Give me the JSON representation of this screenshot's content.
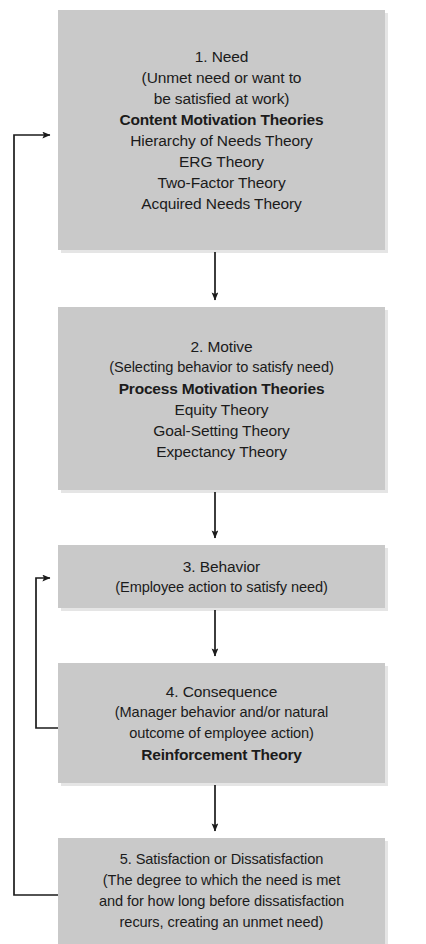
{
  "diagram": {
    "box_fill": "#c9c9c9",
    "line_color": "#1b1b1b",
    "text_color": "#1b1b1b"
  },
  "nodes": [
    {
      "id": "need",
      "step": "1. Need",
      "lines": [
        {
          "text": "1. Need",
          "bold": false
        },
        {
          "text": "(Unmet need or want to",
          "bold": false
        },
        {
          "text": "be satisfied at work)",
          "bold": false
        },
        {
          "text": "Content Motivation Theories",
          "bold": true
        },
        {
          "text": "Hierarchy of Needs Theory",
          "bold": false
        },
        {
          "text": "ERG Theory",
          "bold": false
        },
        {
          "text": "Two-Factor Theory",
          "bold": false
        },
        {
          "text": "Acquired Needs Theory",
          "bold": false
        }
      ]
    },
    {
      "id": "motive",
      "step": "2. Motive",
      "lines": [
        {
          "text": "2.  Motive",
          "bold": false
        },
        {
          "text": "(Selecting behavior to satisfy need)",
          "bold": false
        },
        {
          "text": "Process Motivation Theories",
          "bold": true
        },
        {
          "text": "Equity Theory",
          "bold": false
        },
        {
          "text": "Goal-Setting Theory",
          "bold": false
        },
        {
          "text": "Expectancy Theory",
          "bold": false
        }
      ]
    },
    {
      "id": "behavior",
      "step": "3. Behavior",
      "lines": [
        {
          "text": "3. Behavior",
          "bold": false
        },
        {
          "text": "(Employee action to satisfy need)",
          "bold": false
        }
      ]
    },
    {
      "id": "consequence",
      "step": "4. Consequence",
      "lines": [
        {
          "text": "4. Consequence",
          "bold": false
        },
        {
          "text": "(Manager behavior and/or natural",
          "bold": false
        },
        {
          "text": "outcome of employee action)",
          "bold": false
        },
        {
          "text": "Reinforcement Theory",
          "bold": true
        }
      ]
    },
    {
      "id": "satisfaction",
      "step": "5. Satisfaction or Dissatisfaction",
      "lines": [
        {
          "text": "5. Satisfaction or Dissatisfaction",
          "bold": false
        },
        {
          "text": "(The degree to which the need is met",
          "bold": false
        },
        {
          "text": "and for how long before dissatisfaction",
          "bold": false
        },
        {
          "text": "recurs, creating an unmet need)",
          "bold": false
        }
      ]
    }
  ],
  "connectors": [
    {
      "id": "need-to-motive",
      "from": "need",
      "to": "motive",
      "kind": "down-arrow"
    },
    {
      "id": "motive-to-behavior",
      "from": "motive",
      "to": "behavior",
      "kind": "down-arrow"
    },
    {
      "id": "behavior-to-consequence",
      "from": "behavior",
      "to": "consequence",
      "kind": "down-arrow"
    },
    {
      "id": "consequence-to-satisfaction",
      "from": "consequence",
      "to": "satisfaction",
      "kind": "down-arrow"
    },
    {
      "id": "consequence-feedback-to-behavior",
      "from": "consequence",
      "to": "behavior",
      "kind": "feedback-loop-inner"
    },
    {
      "id": "satisfaction-feedback-to-need",
      "from": "satisfaction",
      "to": "need",
      "kind": "feedback-loop-outer"
    }
  ]
}
